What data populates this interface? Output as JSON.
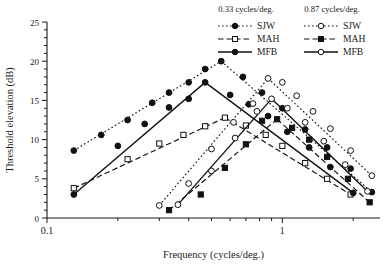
{
  "chart_data": {
    "type": "line",
    "title": "",
    "xlabel": "Frequency (cycles/deg.)",
    "ylabel": "Threshold elevation (dB)",
    "xscale": "log",
    "xlim": [
      0.1,
      2.6
    ],
    "ylim": [
      0,
      25
    ],
    "ytick_labels": [
      "0",
      "5",
      "10",
      "15",
      "20",
      "25"
    ],
    "ytick_values": [
      0,
      5,
      10,
      15,
      20,
      25
    ],
    "xtick_labels": [
      "0.1",
      "1"
    ],
    "xtick_values": [
      0.1,
      1
    ],
    "grid": false,
    "legend_position": "top-right",
    "legend_groups": [
      {
        "header": "0.33 cycles/deg.",
        "entries": [
          {
            "label": "SJW",
            "line": "dotted",
            "marker": "filled-circle"
          },
          {
            "label": "MAH",
            "line": "dashed",
            "marker": "open-square"
          },
          {
            "label": "MFB",
            "line": "solid",
            "marker": "filled-circle"
          }
        ]
      },
      {
        "header": "0.87 cycles/deg.",
        "entries": [
          {
            "label": "SJW",
            "line": "dotted",
            "marker": "open-circle"
          },
          {
            "label": "MAH",
            "line": "dashed",
            "marker": "filled-square"
          },
          {
            "label": "MFB",
            "line": "solid",
            "marker": "open-circle"
          }
        ]
      }
    ],
    "series": [
      {
        "name": "SJW 0.33 cycles/deg.",
        "group": "0.33 cycles/deg.",
        "line": "dotted",
        "marker": "filled-circle",
        "points": [
          [
            0.13,
            8.6
          ],
          [
            0.17,
            10.6
          ],
          [
            0.22,
            12.5
          ],
          [
            0.28,
            14.7
          ],
          [
            0.33,
            16.0
          ],
          [
            0.4,
            17.3
          ],
          [
            0.47,
            19.0
          ],
          [
            0.55,
            20.0
          ],
          [
            0.68,
            18.0
          ],
          [
            0.82,
            16.0
          ],
          [
            1.0,
            14.0
          ],
          [
            1.25,
            11.3
          ],
          [
            1.55,
            9.0
          ],
          [
            1.95,
            6.3
          ],
          [
            2.4,
            3.3
          ]
        ]
      },
      {
        "name": "MAH 0.33 cycles/deg.",
        "group": "0.33 cycles/deg.",
        "line": "dashed",
        "marker": "open-square",
        "points": [
          [
            0.13,
            3.8
          ],
          [
            0.22,
            7.5
          ],
          [
            0.3,
            9.5
          ],
          [
            0.38,
            10.6
          ],
          [
            0.47,
            11.7
          ],
          [
            0.57,
            12.8
          ],
          [
            0.7,
            11.8
          ],
          [
            0.85,
            10.6
          ],
          [
            1.0,
            9.2
          ],
          [
            1.25,
            7.0
          ],
          [
            1.55,
            5.0
          ],
          [
            1.95,
            3.0
          ]
        ]
      },
      {
        "name": "MFB 0.33 cycles/deg.",
        "group": "0.33 cycles/deg.",
        "line": "solid",
        "marker": "filled-circle",
        "points": [
          [
            0.13,
            3.0
          ],
          [
            0.2,
            9.2
          ],
          [
            0.26,
            12.0
          ],
          [
            0.33,
            14.1
          ],
          [
            0.4,
            15.2
          ],
          [
            0.47,
            17.3
          ],
          [
            0.6,
            15.7
          ],
          [
            0.72,
            14.5
          ],
          [
            0.87,
            13.0
          ],
          [
            1.05,
            11.0
          ],
          [
            1.3,
            9.0
          ],
          [
            1.6,
            6.5
          ],
          [
            2.0,
            3.2
          ]
        ]
      },
      {
        "name": "SJW 0.87 cycles/deg.",
        "group": "0.87 cycles/deg.",
        "line": "dotted",
        "marker": "open-circle",
        "points": [
          [
            0.3,
            1.6
          ],
          [
            0.4,
            4.4
          ],
          [
            0.5,
            8.8
          ],
          [
            0.62,
            12.2
          ],
          [
            0.75,
            14.6
          ],
          [
            0.87,
            17.8
          ],
          [
            1.0,
            17.3
          ],
          [
            1.15,
            15.6
          ],
          [
            1.35,
            13.6
          ],
          [
            1.6,
            11.4
          ],
          [
            1.95,
            8.6
          ],
          [
            2.4,
            5.4
          ]
        ]
      },
      {
        "name": "MAH 0.87 cycles/deg.",
        "group": "0.87 cycles/deg.",
        "line": "dashed",
        "marker": "filled-square",
        "points": [
          [
            0.33,
            1.0
          ],
          [
            0.45,
            3.0
          ],
          [
            0.57,
            6.4
          ],
          [
            0.7,
            9.4
          ],
          [
            0.82,
            12.4
          ],
          [
            0.95,
            12.6
          ],
          [
            1.1,
            11.5
          ],
          [
            1.3,
            10.0
          ],
          [
            1.55,
            7.8
          ],
          [
            1.9,
            5.0
          ],
          [
            2.35,
            2.0
          ]
        ]
      },
      {
        "name": "MFB 0.87 cycles/deg.",
        "group": "0.87 cycles/deg.",
        "line": "solid",
        "marker": "open-circle",
        "points": [
          [
            0.36,
            1.7
          ],
          [
            0.5,
            6.0
          ],
          [
            0.63,
            10.2
          ],
          [
            0.78,
            13.6
          ],
          [
            0.9,
            15.2
          ],
          [
            1.05,
            14.0
          ],
          [
            1.25,
            12.2
          ],
          [
            1.5,
            9.8
          ],
          [
            1.85,
            6.8
          ],
          [
            2.3,
            3.4
          ]
        ]
      }
    ]
  }
}
